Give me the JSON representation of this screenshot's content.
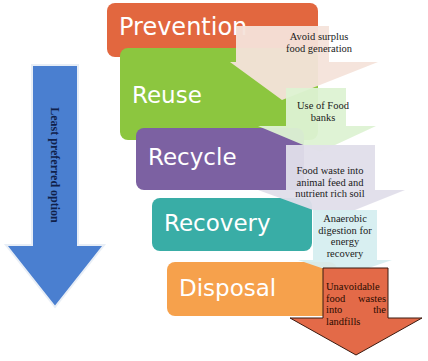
{
  "diagram": {
    "type": "food waste hierarchy",
    "side_arrow": {
      "label": "Least preferred option",
      "color": "#4A7FD0",
      "direction": "down"
    },
    "tiers": [
      {
        "label": "Prevention",
        "color": "#E2673F",
        "note": "Avoid surplus food generation",
        "note_color": "#F3DDD3"
      },
      {
        "label": "Reuse",
        "color": "#8CC63F",
        "note": "Use of  Food banks",
        "note_color": "#DDF2D3"
      },
      {
        "label": "Recycle",
        "color": "#7C61A2",
        "note": "Food waste into animal feed and nutrient rich soil",
        "note_color": "#DCDAE8"
      },
      {
        "label": "Recovery",
        "color": "#39ADA6",
        "note": "Anaerobic digestion for energy recovery",
        "note_color": "#D6EEF0"
      },
      {
        "label": "Disposal",
        "color": "#F6A14C",
        "note": "Unavoidable food wastes into the landfills",
        "note_color": "#E36A48"
      }
    ]
  }
}
